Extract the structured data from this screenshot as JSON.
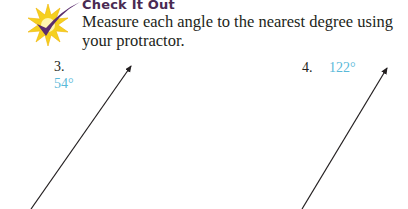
{
  "header": {
    "icon": "checkmark-starburst-icon",
    "title": "Check It Out",
    "instruction": "Measure each angle to the nearest degree using your protractor."
  },
  "problems": [
    {
      "number": "3.",
      "answer": "54°",
      "angle_degrees": 54
    },
    {
      "number": "4.",
      "answer": "122°",
      "angle_degrees": 122
    }
  ],
  "colors": {
    "heading": "#4a2a52",
    "answer": "#5ab9d9",
    "star": "#f5d020",
    "check": "#5b2d6e"
  }
}
